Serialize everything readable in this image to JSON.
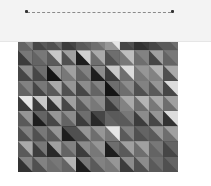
{
  "header": {
    "background": "#f3f3f3",
    "track": {
      "style": "dashed",
      "color": "#8a8a8a"
    },
    "start_marker": {
      "color": "#333333"
    },
    "end_marker": {
      "color": "#333333"
    }
  },
  "mosaic": {
    "columns": 11,
    "rows": 9,
    "split": "diagonal-top-left-to-bottom-right",
    "cells": [
      {
        "top": [
          130,
          90,
          110,
          70,
          100,
          130,
          230,
          80,
          60,
          90,
          110
        ],
        "bottom": [
          100,
          70,
          80,
          60,
          90,
          110,
          150,
          70,
          50,
          70,
          90
        ]
      },
      {
        "top": [
          120,
          120,
          200,
          160,
          210,
          170,
          110,
          190,
          130,
          160,
          120
        ],
        "bottom": [
          60,
          100,
          90,
          80,
          30,
          110,
          80,
          120,
          110,
          70,
          100
        ]
      },
      {
        "top": [
          140,
          110,
          150,
          160,
          130,
          140,
          200,
          220,
          150,
          180,
          170
        ],
        "bottom": [
          70,
          70,
          20,
          120,
          100,
          30,
          60,
          110,
          120,
          130,
          80
        ]
      },
      {
        "top": [
          130,
          120,
          170,
          150,
          140,
          130,
          110,
          140,
          130,
          150,
          220
        ],
        "bottom": [
          100,
          70,
          90,
          80,
          70,
          100,
          20,
          110,
          80,
          90,
          70
        ]
      },
      {
        "top": [
          230,
          200,
          190,
          160,
          140,
          140,
          110,
          170,
          180,
          170,
          160
        ],
        "bottom": [
          60,
          60,
          50,
          70,
          90,
          120,
          60,
          130,
          110,
          120,
          110
        ]
      },
      {
        "top": [
          150,
          100,
          150,
          140,
          110,
          70,
          90,
          120,
          140,
          150,
          220
        ],
        "bottom": [
          90,
          30,
          70,
          100,
          60,
          40,
          100,
          90,
          60,
          70,
          50
        ]
      },
      {
        "top": [
          130,
          120,
          150,
          80,
          150,
          150,
          230,
          130,
          100,
          150,
          160
        ],
        "bottom": [
          80,
          80,
          90,
          30,
          80,
          110,
          120,
          90,
          80,
          90,
          110
        ]
      },
      {
        "top": [
          170,
          120,
          160,
          130,
          140,
          150,
          110,
          160,
          160,
          120,
          100
        ],
        "bottom": [
          90,
          60,
          40,
          100,
          60,
          120,
          30,
          90,
          110,
          100,
          70
        ]
      },
      {
        "top": [
          130,
          130,
          120,
          180,
          120,
          130,
          150,
          140,
          140,
          110,
          100
        ],
        "bottom": [
          50,
          80,
          110,
          100,
          30,
          90,
          120,
          60,
          80,
          90,
          80
        ]
      }
    ]
  }
}
